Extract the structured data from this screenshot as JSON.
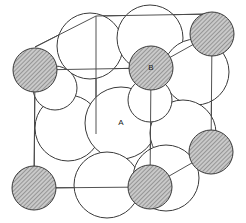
{
  "figure": {
    "width": 246,
    "height": 223,
    "background_color": "#ffffff",
    "outline_color": "#3a3a3a",
    "hatch_fill_color": "#b9b9b9",
    "hatch_line_color": "#555555",
    "open_fill_color": "#ffffff",
    "cell_edge_color": "#4a4a4a"
  },
  "labels": [
    {
      "text": "A",
      "x": 121,
      "y": 123,
      "atom": "A"
    },
    {
      "text": "B",
      "x": 151,
      "y": 68,
      "atom": "B"
    }
  ],
  "chart_data": {
    "type": "scatter",
    "xlabel": "",
    "ylabel": "",
    "xlim": [
      0,
      246
    ],
    "ylim": [
      0,
      223
    ],
    "grid": false,
    "legend": "none",
    "series": [
      {
        "name": "A atoms (large, open)",
        "style": "open-circle",
        "fill": "#ffffff",
        "stroke": "#3a3a3a",
        "points": [
          {
            "x": 90,
            "y": 46,
            "r": 33
          },
          {
            "x": 150,
            "y": 38,
            "r": 33
          },
          {
            "x": 196,
            "y": 72,
            "r": 33
          },
          {
            "x": 68,
            "y": 128,
            "r": 33
          },
          {
            "x": 121,
            "y": 123,
            "r": 36
          },
          {
            "x": 183,
            "y": 133,
            "r": 33
          },
          {
            "x": 107,
            "y": 185,
            "r": 33
          },
          {
            "x": 166,
            "y": 178,
            "r": 33
          },
          {
            "x": 55,
            "y": 88,
            "r": 22
          },
          {
            "x": 150,
            "y": 100,
            "r": 22
          }
        ]
      },
      {
        "name": "B atoms (small, hatched)",
        "style": "hatched-circle",
        "fill": "#b9b9b9",
        "stroke": "#3a3a3a",
        "points": [
          {
            "x": 35,
            "y": 70,
            "r": 22
          },
          {
            "x": 151,
            "y": 68,
            "r": 22
          },
          {
            "x": 212,
            "y": 34,
            "r": 22
          },
          {
            "x": 34,
            "y": 188,
            "r": 22
          },
          {
            "x": 150,
            "y": 187,
            "r": 22
          },
          {
            "x": 211,
            "y": 152,
            "r": 22
          }
        ]
      }
    ],
    "cell_edges": [
      {
        "x1": 35,
        "y1": 70,
        "x2": 151,
        "y2": 68
      },
      {
        "x1": 151,
        "y1": 68,
        "x2": 212,
        "y2": 34
      },
      {
        "x1": 35,
        "y1": 70,
        "x2": 34,
        "y2": 188
      },
      {
        "x1": 151,
        "y1": 68,
        "x2": 150,
        "y2": 187
      },
      {
        "x1": 212,
        "y1": 34,
        "x2": 211,
        "y2": 152
      },
      {
        "x1": 34,
        "y1": 188,
        "x2": 150,
        "y2": 187
      },
      {
        "x1": 150,
        "y1": 187,
        "x2": 211,
        "y2": 152
      },
      {
        "x1": 35,
        "y1": 47,
        "x2": 96,
        "y2": 16
      },
      {
        "x1": 96,
        "y1": 16,
        "x2": 212,
        "y2": 14
      },
      {
        "x1": 96,
        "y1": 16,
        "x2": 96,
        "y2": 134
      }
    ]
  }
}
